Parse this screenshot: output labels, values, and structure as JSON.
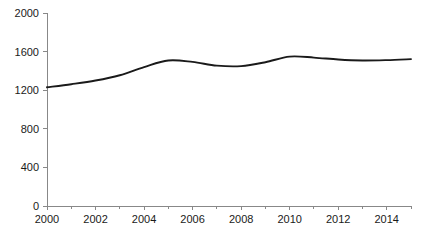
{
  "chart_data": {
    "type": "line",
    "title": "",
    "subtitle": "",
    "xlabel": "",
    "ylabel": "",
    "xlim": [
      2000,
      2015
    ],
    "ylim": [
      0,
      2000
    ],
    "grid": false,
    "legend": null,
    "line_color": "#1a1a1a",
    "axis_color": "#888888",
    "background": "#ffffff",
    "x": [
      2000,
      2001,
      2002,
      2003,
      2004,
      2005,
      2006,
      2007,
      2008,
      2009,
      2010,
      2011,
      2012,
      2013,
      2014,
      2015
    ],
    "values": [
      1230,
      1262,
      1300,
      1355,
      1440,
      1508,
      1493,
      1455,
      1450,
      1490,
      1548,
      1538,
      1518,
      1508,
      1512,
      1522
    ],
    "series": [
      {
        "name": "series-1",
        "values": [
          1230,
          1262,
          1300,
          1355,
          1440,
          1508,
          1493,
          1455,
          1450,
          1490,
          1548,
          1538,
          1518,
          1508,
          1512,
          1522
        ]
      }
    ],
    "x_tick_labels": [
      "2000",
      "2002",
      "2004",
      "2006",
      "2008",
      "2010",
      "2012",
      "2014"
    ],
    "x_tick_values": [
      2000,
      2002,
      2004,
      2006,
      2008,
      2010,
      2012,
      2014
    ],
    "y_tick_labels": [
      "0",
      "400",
      "800",
      "1200",
      "1600",
      "2000"
    ],
    "y_tick_values": [
      0,
      400,
      800,
      1200,
      1600,
      2000
    ]
  }
}
